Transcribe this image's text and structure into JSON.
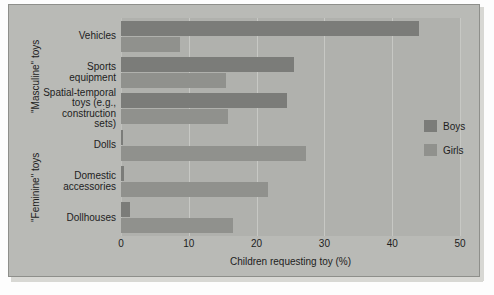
{
  "chart_data": {
    "type": "bar",
    "orientation": "horizontal",
    "title": "",
    "xlabel": "Children requesting toy (%)",
    "ylabel": "",
    "xlim": [
      0,
      50
    ],
    "xticks": [
      "0",
      "10",
      "20",
      "30",
      "40",
      "50"
    ],
    "grid": true,
    "legend_position": "right",
    "categories": [
      "Vehicles",
      "Sports equipment",
      "Spatial-temporal toys (e.g., construction sets)",
      "Dolls",
      "Domestic accessories",
      "Dollhouses"
    ],
    "category_lines": [
      [
        "Vehicles"
      ],
      [
        "Sports",
        "equipment"
      ],
      [
        "Spatial-temporal",
        "toys (e.g.,",
        "construction",
        "sets)"
      ],
      [
        "Dolls"
      ],
      [
        "Domestic",
        "accessories"
      ],
      [
        "Dollhouses"
      ]
    ],
    "group_labels": [
      {
        "text": "\"Masculine\" toys",
        "categories": [
          "Vehicles",
          "Sports equipment",
          "Spatial-temporal toys (e.g., construction sets)"
        ]
      },
      {
        "text": "\"Feminine\" toys",
        "categories": [
          "Dolls",
          "Domestic accessories",
          "Dollhouses"
        ]
      }
    ],
    "series": [
      {
        "name": "Boys",
        "color": "#7b7c79",
        "values": [
          44.0,
          25.5,
          24.5,
          0.3,
          0.5,
          1.3
        ]
      },
      {
        "name": "Girls",
        "color": "#90918d",
        "values": [
          8.7,
          15.5,
          15.8,
          27.3,
          21.7,
          16.5
        ]
      }
    ]
  },
  "legend": {
    "items": [
      {
        "label": "Boys",
        "color": "#7b7c79"
      },
      {
        "label": "Girls",
        "color": "#90918d"
      }
    ]
  },
  "colors": {
    "boys": "#7b7c79",
    "girls": "#90918d",
    "plot_background": "#b0b1ad",
    "plate_background": "#b9bab6",
    "gridline": "#c7c8c4",
    "text": "#1d1d1d"
  }
}
